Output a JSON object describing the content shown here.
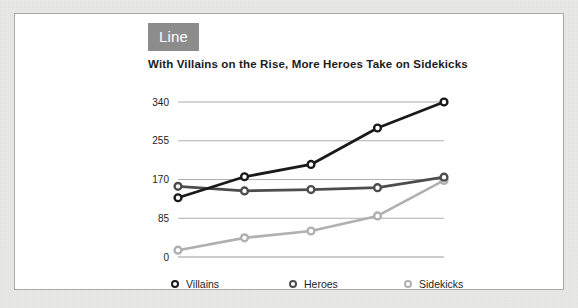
{
  "badge": {
    "label": "Line"
  },
  "chart_data": {
    "type": "line",
    "title": "With Villains on the Rise, More Heroes Take on Sidekicks",
    "xlabel": "",
    "ylabel": "",
    "categories": [
      "2000",
      "2002",
      "2004",
      "2006",
      "2008"
    ],
    "x": [
      2000,
      2002,
      2004,
      2006,
      2008
    ],
    "yticks": [
      0,
      85,
      170,
      255,
      340
    ],
    "ylim": [
      0,
      340
    ],
    "grid": true,
    "legend_position": "bottom",
    "series": [
      {
        "name": "Villains",
        "color": "#1a1a1a",
        "values": [
          130,
          176,
          203,
          283,
          340
        ]
      },
      {
        "name": "Heroes",
        "color": "#4d4d4d",
        "values": [
          155,
          145,
          148,
          152,
          175
        ]
      },
      {
        "name": "Sidekicks",
        "color": "#b0b0b0",
        "values": [
          15,
          42,
          57,
          90,
          168
        ]
      }
    ]
  }
}
